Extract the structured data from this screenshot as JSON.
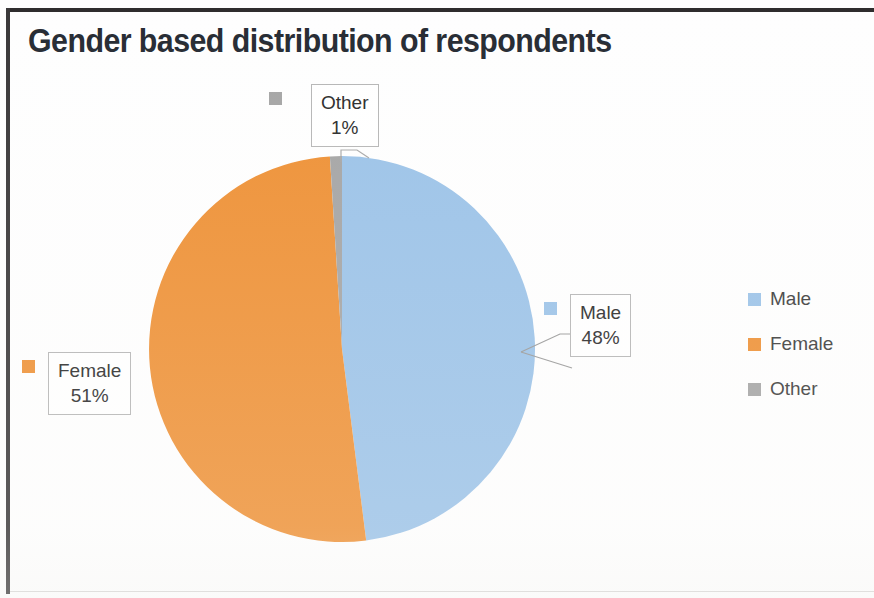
{
  "chart_data": {
    "type": "pie",
    "title": "Gender based distribution of respondents",
    "categories": [
      "Male",
      "Female",
      "Other"
    ],
    "values": [
      48,
      51,
      1
    ],
    "value_labels": [
      "48%",
      "51%",
      "1%"
    ],
    "colors": [
      "#9cc3e8",
      "#ee9136",
      "#a5a5a5"
    ],
    "legend_position": "right",
    "grid": false,
    "xlabel": "",
    "ylabel": "",
    "data_labels": [
      {
        "name": "Male",
        "percent": "48%",
        "color": "#9cc3e8"
      },
      {
        "name": "Female",
        "percent": "51%",
        "color": "#ee9136"
      },
      {
        "name": "Other",
        "percent": "1%",
        "color": "#a5a5a5"
      }
    ]
  },
  "title": {
    "text": "Gender based distribution of respondents"
  },
  "labels": {
    "other": {
      "name": "Other",
      "percent": "1%"
    },
    "female": {
      "name": "Female",
      "percent": "51%"
    },
    "male": {
      "name": "Male",
      "percent": "48%"
    }
  },
  "legend": {
    "items": [
      {
        "label": "Male",
        "color": "#9cc3e8"
      },
      {
        "label": "Female",
        "color": "#ee9136"
      },
      {
        "label": "Other",
        "color": "#a5a5a5"
      }
    ]
  }
}
